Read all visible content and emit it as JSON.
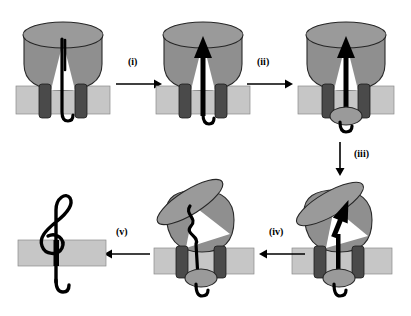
{
  "figure": {
    "panel_count": 6,
    "step_arrows": [
      {
        "id": "i",
        "label": "(i)",
        "direction": "right",
        "from_panel": 1,
        "to_panel": 2
      },
      {
        "id": "ii",
        "label": "(ii)",
        "direction": "right",
        "from_panel": 2,
        "to_panel": 3
      },
      {
        "id": "iii",
        "label": "(iii)",
        "direction": "down",
        "from_panel": 3,
        "to_panel": 4
      },
      {
        "id": "iv",
        "label": "(iv)",
        "direction": "left",
        "from_panel": 4,
        "to_panel": 5
      },
      {
        "id": "v",
        "label": "(v)",
        "direction": "left",
        "from_panel": 5,
        "to_panel": 6
      }
    ]
  },
  "colors": {
    "background": "#ffffff",
    "chaperone_body": "#8f8f8f",
    "chaperone_lid": "#9a9a9a",
    "membrane_light": "#c6c6c6",
    "transmembrane_helix": "#4a4a4a",
    "substrate_black": "#000000",
    "notch_white": "#ffffff",
    "outline": "#262626"
  },
  "panels": [
    {
      "index": 1,
      "name": "panel-1-upright-closed",
      "description": "Upright chaperone dome with flat elliptical lid seated on membrane; black hairpin substrate threaded through two transmembrane helices with hook below.",
      "lid_tilt_deg": 0,
      "substrate_shape": "hairpin-hook",
      "has_bottom_ellipse": false,
      "has_arrowhead": false
    },
    {
      "index": 2,
      "name": "panel-2-arrow-up",
      "description": "Same upright assembly; substrate now drawn as a thick black upward arrow inside the dome with an extended tail and hook below the membrane.",
      "lid_tilt_deg": 0,
      "substrate_shape": "up-arrow-with-tail-hook",
      "has_bottom_ellipse": false,
      "has_arrowhead": true
    },
    {
      "index": 3,
      "name": "panel-3-arrow-up-with-cap",
      "description": "Upright assembly with upward black arrow; a gray ellipse (folded domain) has appeared beneath the membrane with a short hook below it.",
      "lid_tilt_deg": 0,
      "substrate_shape": "up-arrow-with-tail-hook",
      "has_bottom_ellipse": true,
      "has_arrowhead": true
    },
    {
      "index": 4,
      "name": "panel-4-tilted-lid",
      "description": "Lid tilted open to the upper-left; black arrow now angled diagonally inside the dome; gray ellipse and hook remain below the membrane.",
      "lid_tilt_deg": -30,
      "substrate_shape": "angled-arrow",
      "has_bottom_ellipse": true,
      "has_arrowhead": true
    },
    {
      "index": 5,
      "name": "panel-5-zigzag",
      "description": "Lid tilted open; the substrate inside the dome is now an unfolded black zigzag chain; gray ellipse and hook remain below the membrane.",
      "lid_tilt_deg": -32,
      "substrate_shape": "zigzag-chain",
      "has_bottom_ellipse": true,
      "has_arrowhead": false
    },
    {
      "index": 6,
      "name": "panel-6-treble-clef",
      "description": "Chaperone has departed; the folded substrate is drawn as a black treble-clef shape passing through the bare light-gray membrane with a hook tail below.",
      "lid_tilt_deg": null,
      "substrate_shape": "treble-clef",
      "has_bottom_ellipse": false,
      "has_arrowhead": false
    }
  ]
}
